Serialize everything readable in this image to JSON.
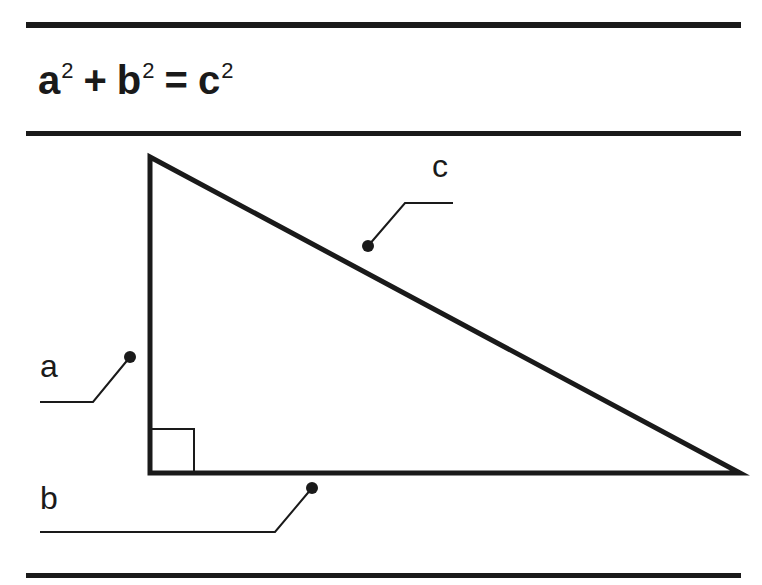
{
  "formula": {
    "a": "a",
    "a_exp": "2",
    "plus": "+",
    "b": "b",
    "b_exp": "2",
    "equals": "=",
    "c": "c",
    "c_exp": "2"
  },
  "diagram": {
    "type": "right-triangle",
    "labels": {
      "a": "a",
      "b": "b",
      "c": "c"
    },
    "vertices": {
      "top": [
        150,
        157
      ],
      "right_angle": [
        150,
        473
      ],
      "right": [
        740,
        473
      ]
    },
    "stroke_color": "#1a1a1a",
    "background": "#ffffff"
  }
}
